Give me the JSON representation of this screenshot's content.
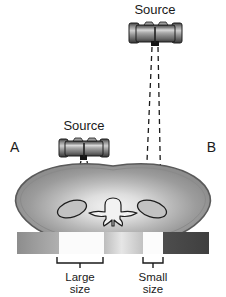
{
  "figure": {
    "title_alt": "X-ray beam geometry through abdominal cross-section",
    "panels": {
      "left_label": "A",
      "right_label": "B"
    },
    "sources": [
      {
        "id": "source-top-right",
        "label": "Source",
        "position": "top-right",
        "distance": "far"
      },
      {
        "id": "source-left",
        "label": "Source",
        "position": "mid-left",
        "distance": "near"
      }
    ],
    "beam_labels": [
      {
        "id": "large-size",
        "line1": "Large",
        "line2": "size"
      },
      {
        "id": "small-size",
        "line1": "Small",
        "line2": "size"
      }
    ],
    "anatomy": {
      "body_name": "abdominal-cross-section",
      "vertebra_name": "vertebra",
      "kidney_left_name": "kidney-left",
      "kidney_right_name": "kidney-right"
    },
    "detector": {
      "name": "detector-strip",
      "segments": [
        {
          "id": "seg-1",
          "shade": "#9a9a9a"
        },
        {
          "id": "seg-2",
          "shade": "#fbfbfb"
        },
        {
          "id": "seg-3",
          "shade": "#c8c8c8"
        },
        {
          "id": "seg-4",
          "shade": "#fcfcfc"
        },
        {
          "id": "seg-5",
          "shade": "#4a4a4a"
        }
      ]
    },
    "colors": {
      "ink": "#1a1a1a",
      "body_fill_outer": "#9e9e9e",
      "body_fill_inner": "#efefef",
      "source_metal_light": "#dcdcdc",
      "source_metal_dark": "#4f4f4f",
      "background": "#ffffff"
    }
  }
}
